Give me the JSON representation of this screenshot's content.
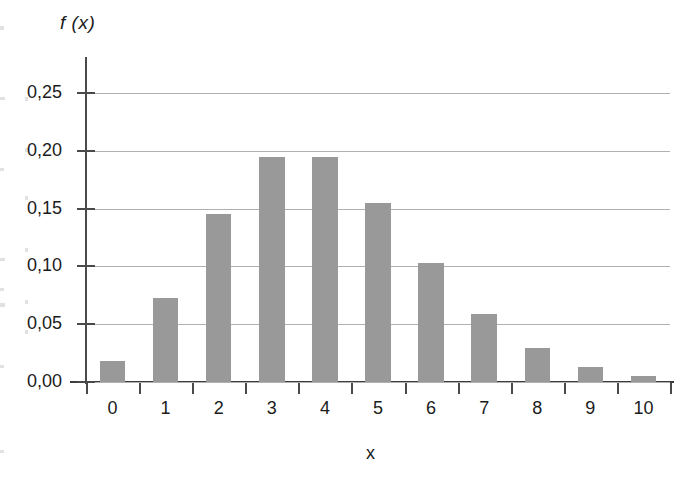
{
  "chart_data": {
    "type": "bar",
    "title": "",
    "subtitle": "",
    "xlabel": "x",
    "ylabel": "f (x)",
    "categories": [
      "0",
      "1",
      "2",
      "3",
      "4",
      "5",
      "6",
      "7",
      "8",
      "9",
      "10"
    ],
    "values": [
      0.018,
      0.073,
      0.145,
      0.195,
      0.195,
      0.155,
      0.103,
      0.059,
      0.029,
      0.013,
      0.005
    ],
    "ylim": [
      0.0,
      0.25
    ],
    "ytick_values": [
      0.25,
      0.2,
      0.15,
      0.1,
      0.05,
      0.0
    ],
    "ytick_labels": [
      "0,25",
      "0,20",
      "0,15",
      "0,10",
      "0,05",
      "0,00"
    ],
    "xtick_labels": [
      "0",
      "1",
      "2",
      "3",
      "4",
      "5",
      "6",
      "7",
      "8",
      "9",
      "10"
    ],
    "grid": "horizontal",
    "legend": "none",
    "bar_color": "#999999",
    "gridline_color": "#b0b0b0",
    "axis_color": "#4a4a4a",
    "decimal_separator": ","
  }
}
